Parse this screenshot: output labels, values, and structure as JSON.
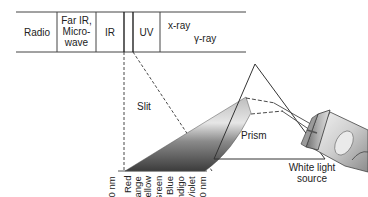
{
  "diagram": {
    "type": "electromagnetic-spectrum-prism",
    "spectrum_band": {
      "segments": [
        {
          "label": "Radio"
        },
        {
          "label_lines": [
            "Far IR,",
            "Micro-",
            "wave"
          ]
        },
        {
          "label": "IR"
        },
        {
          "label": ""
        },
        {
          "label": "UV"
        },
        {
          "label": "x-ray"
        },
        {
          "label": "γ-ray"
        }
      ]
    },
    "labels": {
      "slit": "Slit",
      "prism": "Prism",
      "source_line1": "White light",
      "source_line2": "source"
    },
    "visible_spectrum": [
      "750 nm",
      "Red",
      "Orange",
      "Yellow",
      "Green",
      "Blue",
      "Indigo",
      "Violet",
      "400 nm"
    ],
    "colors": {
      "line": "#333333",
      "beam_dark": "#4a4a4a",
      "beam_light": "#d8d8d8"
    }
  }
}
